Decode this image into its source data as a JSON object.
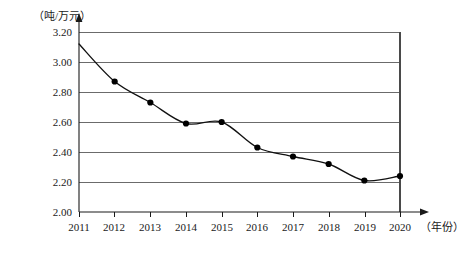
{
  "chart_data": {
    "type": "line",
    "title": "",
    "subtitle": "",
    "xlabel": "（年份）",
    "ylabel": "（吨/万元）",
    "categories": [
      "2011",
      "2012",
      "2013",
      "2014",
      "2015",
      "2016",
      "2017",
      "2018",
      "2019",
      "2020"
    ],
    "values": [
      3.12,
      2.87,
      2.73,
      2.59,
      2.6,
      2.43,
      2.37,
      2.32,
      2.21,
      2.24
    ],
    "series": [
      {
        "name": "单位GDP能耗",
        "values": [
          3.12,
          2.87,
          2.73,
          2.59,
          2.6,
          2.43,
          2.37,
          2.32,
          2.21,
          2.24
        ]
      }
    ],
    "ylim": [
      2.0,
      3.2
    ],
    "xlim": [
      "2011",
      "2020"
    ],
    "ytick_labels": [
      "2.00",
      "2.20",
      "2.40",
      "2.60",
      "2.80",
      "3.00",
      "3.20"
    ],
    "ytick_values": [
      2.0,
      2.2,
      2.4,
      2.6,
      2.8,
      3.0,
      3.2
    ],
    "xtick_labels": [
      "2011",
      "2012",
      "2013",
      "2014",
      "2015",
      "2016",
      "2017",
      "2018",
      "2019",
      "2020"
    ],
    "grid": true,
    "grid_orientation": "horizontal",
    "legend": "none",
    "marker": "filled-circle",
    "line_color": "#111111",
    "grid_color": "#6b6b6b",
    "marker_color": "#000000",
    "background_color": "#ffffff",
    "first_point_marker_visible": false,
    "annotations": []
  },
  "axes": {
    "y_axis_unit_label": "（吨/万元）",
    "x_axis_unit_label": "（年份）"
  },
  "yticks": [
    {
      "label": "3.20",
      "value": 3.2
    },
    {
      "label": "3.00",
      "value": 3.0
    },
    {
      "label": "2.80",
      "value": 2.8
    },
    {
      "label": "2.60",
      "value": 2.6
    },
    {
      "label": "2.40",
      "value": 2.4
    },
    {
      "label": "2.20",
      "value": 2.2
    },
    {
      "label": "2.00",
      "value": 2.0
    }
  ],
  "xticks": [
    {
      "label": "2011"
    },
    {
      "label": "2012"
    },
    {
      "label": "2013"
    },
    {
      "label": "2014"
    },
    {
      "label": "2015"
    },
    {
      "label": "2016"
    },
    {
      "label": "2017"
    },
    {
      "label": "2018"
    },
    {
      "label": "2019"
    },
    {
      "label": "2020"
    }
  ]
}
